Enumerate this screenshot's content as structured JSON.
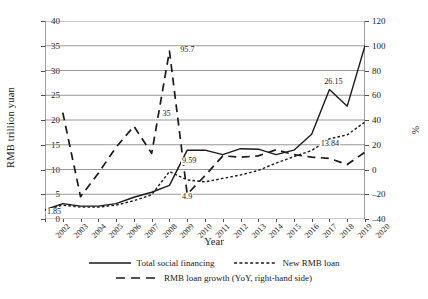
{
  "chart_data": {
    "type": "line",
    "title": "",
    "xlabel": "Year",
    "ylabel": "RMB trillion yuan",
    "ylabel_right": "%",
    "grid": true,
    "legend_position": "bottom",
    "ylim": [
      0,
      40
    ],
    "ylim_right": [
      -40,
      120
    ],
    "yticks": [
      0,
      5,
      10,
      15,
      20,
      25,
      30,
      35,
      40
    ],
    "yticks_right": [
      -40,
      -20,
      0,
      20,
      40,
      60,
      80,
      100,
      120
    ],
    "categories": [
      "2002",
      "2003",
      "2004",
      "2005",
      "2006",
      "2007",
      "2008",
      "2009",
      "2010",
      "2011",
      "2012",
      "2013",
      "2014",
      "2015",
      "2016",
      "2017",
      "2018",
      "2019",
      "2020"
    ],
    "series": [
      {
        "name": "Total social financing",
        "style": "solid",
        "axis": "left",
        "values": [
          1.85,
          3.1,
          2.6,
          2.6,
          3.1,
          4.4,
          5.4,
          6.8,
          13.9,
          13.9,
          13.0,
          14.2,
          14.1,
          13.0,
          13.9,
          17.1,
          26.15,
          22.8,
          35.0
        ]
      },
      {
        "name": "New RMB loan",
        "style": "dotted",
        "axis": "left",
        "values": [
          1.85,
          2.8,
          2.4,
          2.4,
          2.8,
          3.7,
          4.9,
          9.59,
          7.9,
          7.5,
          8.2,
          8.9,
          9.8,
          11.3,
          12.6,
          13.84,
          16.2,
          17.0,
          19.6
        ]
      },
      {
        "name": "RMB loan growth (YoY, right-hand side)",
        "style": "dashed",
        "axis": "right",
        "values": [
          null,
          46,
          -22,
          -3,
          18,
          35,
          13,
          95.7,
          -20,
          -5,
          11,
          10,
          11,
          16,
          12,
          10,
          9,
          4,
          14
        ]
      }
    ],
    "annotations": [
      {
        "text": "1.85",
        "x": 0.5,
        "y": 1.2,
        "axis": "left"
      },
      {
        "text": "35",
        "x": 7.0,
        "y": 21.0,
        "axis": "left"
      },
      {
        "text": "95.7",
        "x": 8.0,
        "y": 34.0,
        "axis": "left"
      },
      {
        "text": "9.59",
        "x": 8.1,
        "y": 11.5,
        "axis": "left"
      },
      {
        "text": "4.9",
        "x": 8.1,
        "y": 4.3,
        "axis": "left"
      },
      {
        "text": "26.15",
        "x": 16.1,
        "y": 27.5,
        "axis": "left"
      },
      {
        "text": "13.84",
        "x": 15.9,
        "y": 15.0,
        "axis": "left"
      }
    ]
  },
  "axes": {
    "y_left_title": "RMB trillion yuan",
    "y_right_title": "%",
    "x_title": "Year"
  },
  "legend": {
    "items": [
      {
        "label": "Total social financing",
        "style": "solid"
      },
      {
        "label": "New RMB loan",
        "style": "dotted"
      },
      {
        "label": "RMB loan growth (YoY, right-hand side)",
        "style": "dashed"
      }
    ]
  },
  "colors": {
    "line": "#1a1a1a",
    "grid": "#8c8c8c",
    "axis": "#6f6f6f",
    "background": "#ffffff"
  }
}
